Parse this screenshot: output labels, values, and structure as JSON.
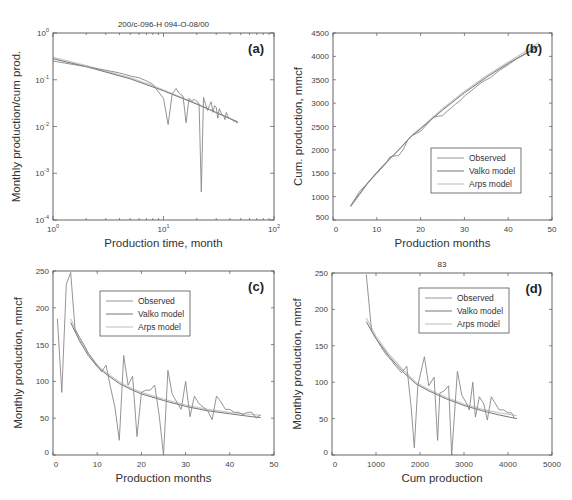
{
  "colors": {
    "observed": "#888888",
    "valko": "#777777",
    "arps": "#c8c8c8",
    "axis": "#555555"
  },
  "legend": [
    "Observed",
    "Valko model",
    "Arps model"
  ],
  "chart_data": [
    {
      "id": "a",
      "type": "line",
      "panel_label": "(a)",
      "title": "200/c-096-H 094-O-08/00",
      "xlabel": "Production time, month",
      "ylabel": "Monthly production/cum prod.",
      "xscale": "log",
      "yscale": "log",
      "xlim": [
        1,
        100
      ],
      "ylim": [
        0.0001,
        1
      ],
      "xticks": [
        "10^0",
        "10^1",
        "10^2"
      ],
      "yticks": [
        "10^-4",
        "10^-3",
        "10^-2",
        "10^-1",
        "10^0"
      ],
      "legend": false,
      "series": [
        {
          "name": "Observed",
          "x": [
            1,
            2,
            3,
            4,
            5,
            6,
            7,
            8,
            9,
            10,
            11,
            12,
            13,
            14,
            15,
            16,
            17,
            18,
            19,
            20,
            21,
            22,
            23,
            24,
            25,
            26,
            27,
            28,
            29,
            30,
            31,
            32,
            33,
            34,
            35,
            36,
            37,
            38,
            39,
            40,
            41,
            42,
            43,
            44,
            45,
            46,
            47
          ],
          "y": [
            0.25,
            0.19,
            0.16,
            0.14,
            0.12,
            0.11,
            0.095,
            0.08,
            0.055,
            0.04,
            0.011,
            0.05,
            0.065,
            0.05,
            0.045,
            0.012,
            0.04,
            0.035,
            0.038,
            0.035,
            0.03,
            0.0004,
            0.042,
            0.03,
            0.022,
            0.028,
            0.034,
            0.02,
            0.028,
            0.026,
            0.015,
            0.024,
            0.02,
            0.018,
            0.017,
            0.014,
            0.02,
            0.017,
            0.015,
            0.015,
            0.014,
            0.014,
            0.013,
            0.013,
            0.013,
            0.012,
            0.012
          ]
        },
        {
          "name": "Valko model",
          "x": [
            1,
            2,
            5,
            10,
            20,
            47
          ],
          "y": [
            0.28,
            0.19,
            0.105,
            0.058,
            0.03,
            0.0125
          ]
        },
        {
          "name": "Arps model",
          "x": [
            1,
            2,
            5,
            8,
            10,
            20,
            47
          ],
          "y": [
            0.3,
            0.2,
            0.11,
            0.075,
            0.06,
            0.031,
            0.0125
          ]
        }
      ]
    },
    {
      "id": "b",
      "type": "line",
      "panel_label": "(b)",
      "title": "",
      "xlabel": "Production months",
      "ylabel": "Cum. production, mmcf",
      "xlim": [
        0,
        50
      ],
      "ylim": [
        500,
        4500
      ],
      "xticks": [
        0,
        10,
        20,
        30,
        40,
        50
      ],
      "yticks": [
        500,
        1000,
        1500,
        2000,
        2500,
        3000,
        3500,
        4000,
        4500
      ],
      "legend": true,
      "series": [
        {
          "name": "Observed",
          "x": [
            4,
            5,
            6,
            8,
            10,
            12,
            13,
            14,
            15,
            16,
            17,
            18,
            19,
            20,
            21,
            22,
            23,
            24,
            25,
            26,
            27,
            28,
            29,
            30,
            32,
            34,
            36,
            38,
            40,
            42,
            44,
            46,
            47
          ],
          "y": [
            800,
            950,
            1100,
            1300,
            1500,
            1700,
            1850,
            1870,
            1880,
            2000,
            2200,
            2300,
            2350,
            2400,
            2500,
            2600,
            2700,
            2720,
            2730,
            2820,
            2900,
            2980,
            3050,
            3150,
            3300,
            3450,
            3550,
            3700,
            3820,
            3950,
            4050,
            4150,
            4220
          ]
        },
        {
          "name": "Valko model",
          "x": [
            4,
            6,
            8,
            10,
            12,
            15,
            18,
            20,
            25,
            30,
            35,
            40,
            45,
            47
          ],
          "y": [
            800,
            1050,
            1300,
            1520,
            1720,
            2000,
            2300,
            2450,
            2850,
            3220,
            3550,
            3850,
            4120,
            4230
          ]
        },
        {
          "name": "Arps model",
          "x": [
            4,
            6,
            8,
            10,
            12,
            15,
            18,
            20,
            25,
            30,
            35,
            40,
            45,
            47
          ],
          "y": [
            780,
            1040,
            1290,
            1510,
            1710,
            2000,
            2310,
            2470,
            2880,
            3250,
            3580,
            3880,
            4170,
            4300
          ]
        }
      ]
    },
    {
      "id": "c",
      "type": "line",
      "panel_label": "(c)",
      "title": "",
      "xlabel": "Production months",
      "ylabel": "Monthly production, mmcf",
      "xlim": [
        0,
        50
      ],
      "ylim": [
        0,
        250
      ],
      "xticks": [
        0,
        10,
        20,
        30,
        40,
        50
      ],
      "yticks": [
        0,
        50,
        100,
        150,
        200,
        250
      ],
      "legend": true,
      "series": [
        {
          "name": "Observed",
          "x": [
            1,
            2,
            3,
            4,
            5,
            6,
            7,
            8,
            9,
            10,
            11,
            12,
            13,
            14,
            15,
            16,
            17,
            18,
            19,
            20,
            21,
            22,
            23,
            24,
            25,
            26,
            27,
            28,
            29,
            30,
            31,
            32,
            33,
            34,
            35,
            36,
            37,
            38,
            39,
            40,
            41,
            42,
            43,
            44,
            45,
            46,
            47
          ],
          "y": [
            185,
            85,
            232,
            248,
            170,
            160,
            150,
            138,
            130,
            122,
            113,
            122,
            92,
            65,
            20,
            135,
            95,
            107,
            25,
            85,
            88,
            88,
            95,
            55,
            0,
            115,
            82,
            72,
            62,
            100,
            52,
            80,
            70,
            65,
            60,
            48,
            80,
            72,
            62,
            62,
            58,
            58,
            55,
            58,
            58,
            50,
            55
          ]
        },
        {
          "name": "Valko model",
          "x": [
            4,
            6,
            8,
            10,
            12,
            15,
            18,
            20,
            25,
            30,
            35,
            40,
            45,
            47
          ],
          "y": [
            180,
            155,
            135,
            120,
            110,
            97,
            88,
            83,
            74,
            66,
            60,
            56,
            52,
            51
          ]
        },
        {
          "name": "Arps model",
          "x": [
            4,
            6,
            8,
            10,
            12,
            15,
            18,
            20,
            25,
            30,
            35,
            40,
            45,
            47
          ],
          "y": [
            185,
            158,
            138,
            122,
            112,
            99,
            90,
            85,
            76,
            68,
            62,
            58,
            55,
            54
          ]
        }
      ]
    },
    {
      "id": "d",
      "type": "line",
      "panel_label": "(d)",
      "title": "83",
      "xlabel": "Cum production",
      "ylabel": "Monthly production, mmcf",
      "xlim": [
        0,
        5000
      ],
      "ylim": [
        0,
        250
      ],
      "xticks": [
        0,
        1000,
        2000,
        3000,
        4000,
        5000
      ],
      "yticks": [
        0,
        50,
        100,
        150,
        200,
        250
      ],
      "legend": true,
      "series": [
        {
          "name": "Observed",
          "x": [
            780,
            900,
            1000,
            1100,
            1230,
            1350,
            1450,
            1580,
            1700,
            1800,
            1870,
            1950,
            2100,
            2200,
            2320,
            2400,
            2450,
            2550,
            2650,
            2720,
            2850,
            2950,
            3050,
            3120,
            3200,
            3260,
            3350,
            3450,
            3530,
            3620,
            3700,
            3800,
            3900,
            4000,
            4080,
            4150
          ],
          "y": [
            248,
            170,
            160,
            150,
            138,
            130,
            122,
            113,
            122,
            65,
            10,
            95,
            135,
            95,
            107,
            20,
            85,
            88,
            95,
            0,
            115,
            82,
            72,
            62,
            100,
            52,
            80,
            70,
            48,
            80,
            72,
            62,
            62,
            58,
            58,
            50
          ]
        },
        {
          "name": "Valko model",
          "x": [
            780,
            1000,
            1300,
            1600,
            1900,
            2200,
            2600,
            3000,
            3400,
            3800,
            4200
          ],
          "y": [
            183,
            160,
            135,
            115,
            98,
            88,
            77,
            68,
            61,
            55,
            50
          ]
        },
        {
          "name": "Arps model",
          "x": [
            780,
            1000,
            1300,
            1600,
            1900,
            2200,
            2600,
            3000,
            3400,
            3800,
            4200
          ],
          "y": [
            188,
            163,
            138,
            118,
            100,
            90,
            79,
            70,
            63,
            58,
            54
          ]
        }
      ]
    }
  ],
  "panels_layout": {
    "a": {
      "x0": 53,
      "x1": 274,
      "y0": 33,
      "y1": 220
    },
    "b": {
      "x0": 333,
      "x1": 552,
      "y0": 33,
      "y1": 220
    },
    "c": {
      "x0": 53,
      "x1": 274,
      "y0": 271,
      "y1": 455
    },
    "d": {
      "x0": 332,
      "x1": 552,
      "y0": 273,
      "y1": 455
    }
  }
}
